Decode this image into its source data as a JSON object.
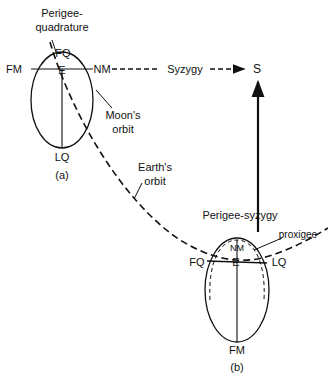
{
  "diagram": {
    "panel_a": {
      "label": "(a)",
      "title_line1": "Perigee-",
      "title_line2": "quadrature",
      "points": {
        "fq": "FQ",
        "fm": "FM",
        "e": "E",
        "nm": "NM",
        "lq": "LQ"
      },
      "moon_orbit_line1": "Moon's",
      "moon_orbit_line2": "orbit"
    },
    "syzygy": {
      "label": "Syzygy",
      "target": "S"
    },
    "earth_orbit": {
      "line1": "Earth's",
      "line2": "orbit"
    },
    "panel_b": {
      "label": "(b)",
      "title": "Perigee-syzygy",
      "proxigee": "proxigee",
      "points": {
        "nm": "NM",
        "fq": "FQ",
        "e": "E",
        "lq": "LQ",
        "fm": "FM"
      }
    },
    "colors": {
      "ink": "#111111",
      "background": "#ffffff"
    }
  }
}
